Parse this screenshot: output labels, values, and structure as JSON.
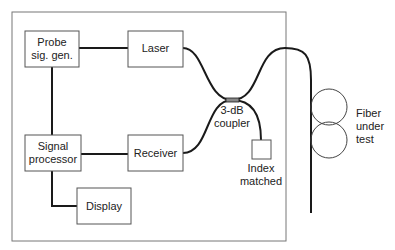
{
  "diagram": {
    "blocks": {
      "probe_signal_generator": {
        "label_line1": "Probe",
        "label_line2": "sig. gen."
      },
      "laser": {
        "label": "Laser"
      },
      "signal_processor": {
        "label_line1": "Signal",
        "label_line2": "processor"
      },
      "receiver": {
        "label": "Receiver"
      },
      "display": {
        "label": "Display"
      }
    },
    "coupler": {
      "label_line1": "3-dB",
      "label_line2": "coupler"
    },
    "index_matched": {
      "label_line1": "Index",
      "label_line2": "matched"
    },
    "fiber_under_test": {
      "label_line1": "Fiber",
      "label_line2": "under",
      "label_line3": "test"
    },
    "colors": {
      "line": "#1a1a1a",
      "box_border": "#555555",
      "enclosure": "#777777"
    }
  }
}
